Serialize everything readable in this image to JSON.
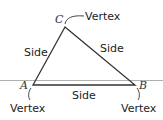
{
  "diagram": {
    "colors": {
      "line": "#333333",
      "baseline": "#b0b0b0",
      "text": "#222222"
    },
    "vertices": [
      {
        "name": "A",
        "callout": "Vertex"
      },
      {
        "name": "B",
        "callout": "Vertex"
      },
      {
        "name": "C",
        "callout": "Vertex"
      }
    ],
    "sides": [
      {
        "label": "Side",
        "between": "A-C"
      },
      {
        "label": "Side",
        "between": "C-B"
      },
      {
        "label": "Side",
        "between": "A-B"
      }
    ]
  }
}
